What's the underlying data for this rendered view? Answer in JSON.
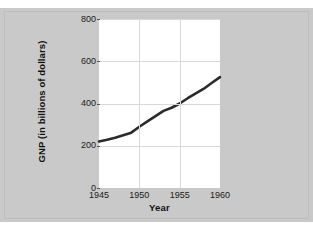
{
  "figure": {
    "background_color": "#c9c9c9",
    "page_color": "#ffffff",
    "plot_background": "#ffffff",
    "line_color": "#2b2b2b",
    "grid_color": "#d8d8d8"
  },
  "chart_data": {
    "type": "line",
    "title": "",
    "xlabel": "Year",
    "ylabel": "GNP (in billions of dollars)",
    "x": [
      1945,
      1946,
      1947,
      1948,
      1949,
      1950,
      1951,
      1952,
      1953,
      1954,
      1955,
      1956,
      1957,
      1958,
      1959,
      1960
    ],
    "values": [
      220,
      228,
      238,
      250,
      262,
      290,
      315,
      340,
      365,
      380,
      400,
      425,
      448,
      470,
      498,
      525
    ],
    "series": [
      {
        "name": "GNP",
        "values": [
          220,
          228,
          238,
          250,
          262,
          290,
          315,
          340,
          365,
          380,
          400,
          425,
          448,
          470,
          498,
          525
        ]
      }
    ],
    "xlim": [
      1945,
      1960
    ],
    "ylim": [
      0,
      800
    ],
    "xticks": [
      1945,
      1950,
      1955,
      1960
    ],
    "xtick_labels": [
      "1945",
      "1950",
      "1955",
      "1960"
    ],
    "yticks": [
      0,
      200,
      400,
      600,
      800
    ],
    "ytick_labels": [
      "0",
      "200",
      "400",
      "600",
      "800"
    ],
    "grid": true,
    "legend": null,
    "legend_position": "none",
    "annotations": []
  },
  "axis": {
    "x_title": "Year",
    "y_title": "GNP (in billions of dollars)"
  }
}
